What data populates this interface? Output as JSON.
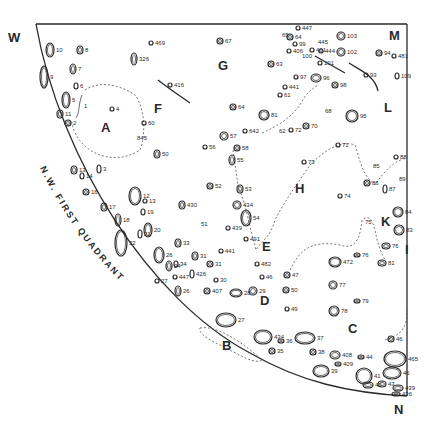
{
  "map": {
    "title": "N.W. FIRST QUADRANT",
    "corners": {
      "west": "W",
      "mare": "M",
      "north": "N"
    },
    "region_letters": [
      {
        "id": "A",
        "x": 101,
        "y": 132
      },
      {
        "id": "B",
        "x": 222,
        "y": 350
      },
      {
        "id": "C",
        "x": 348,
        "y": 333
      },
      {
        "id": "D",
        "x": 260,
        "y": 305
      },
      {
        "id": "E",
        "x": 262,
        "y": 251
      },
      {
        "id": "F",
        "x": 154,
        "y": 113
      },
      {
        "id": "G",
        "x": 218,
        "y": 70
      },
      {
        "id": "H",
        "x": 295,
        "y": 193
      },
      {
        "id": "I",
        "x": 405,
        "y": 254
      },
      {
        "id": "K",
        "x": 381,
        "y": 226
      },
      {
        "id": "L",
        "x": 384,
        "y": 112
      }
    ],
    "craters": [
      {
        "label": "10",
        "x": 50,
        "y": 50,
        "rx": 4,
        "ry": 7
      },
      {
        "label": "8",
        "x": 80,
        "y": 50,
        "rx": 3,
        "ry": 4
      },
      {
        "label": "7",
        "x": 73,
        "y": 69,
        "rx": 3,
        "ry": 5
      },
      {
        "label": "9",
        "x": 44,
        "y": 77,
        "rx": 4,
        "ry": 11
      },
      {
        "label": "6",
        "x": 76,
        "y": 86,
        "rx": 2,
        "ry": 3
      },
      {
        "label": "5",
        "x": 66,
        "y": 100,
        "rx": 4,
        "ry": 8
      },
      {
        "label": "1",
        "x": 82,
        "y": 106,
        "rx": 0,
        "ry": 0
      },
      {
        "label": "11",
        "x": 60,
        "y": 114,
        "rx": 3,
        "ry": 4
      },
      {
        "label": "2",
        "x": 68,
        "y": 123,
        "rx": 3,
        "ry": 3
      },
      {
        "label": "4",
        "x": 112,
        "y": 109,
        "rx": 2,
        "ry": 2
      },
      {
        "label": "469",
        "x": 151,
        "y": 43,
        "rx": 2,
        "ry": 2
      },
      {
        "label": "326",
        "x": 134,
        "y": 59,
        "rx": 3,
        "ry": 6
      },
      {
        "label": "416",
        "x": 170,
        "y": 85,
        "rx": 2,
        "ry": 2
      },
      {
        "label": "60",
        "x": 144,
        "y": 123,
        "rx": 2,
        "ry": 2
      },
      {
        "label": "845",
        "x": 135,
        "y": 138,
        "rx": 0,
        "ry": 0
      },
      {
        "label": "67",
        "x": 220,
        "y": 41,
        "rx": 3,
        "ry": 3
      },
      {
        "label": "13",
        "x": 74,
        "y": 170,
        "rx": 3,
        "ry": 4
      },
      {
        "label": "14",
        "x": 82,
        "y": 176,
        "rx": 2,
        "ry": 3
      },
      {
        "label": "3",
        "x": 99,
        "y": 169,
        "rx": 2,
        "ry": 4
      },
      {
        "label": "16",
        "x": 86,
        "y": 192,
        "rx": 3,
        "ry": 3
      },
      {
        "label": "17",
        "x": 104,
        "y": 207,
        "rx": 3,
        "ry": 4
      },
      {
        "label": "18",
        "x": 118,
        "y": 220,
        "rx": 3,
        "ry": 6
      },
      {
        "label": "22",
        "x": 121,
        "y": 243,
        "rx": 6,
        "ry": 13
      },
      {
        "label": "12",
        "x": 135,
        "y": 196,
        "rx": 6,
        "ry": 9
      },
      {
        "label": "13",
        "x": 145,
        "y": 201,
        "rx": 2,
        "ry": 2
      },
      {
        "label": "19",
        "x": 143,
        "y": 212,
        "rx": 2,
        "ry": 3
      },
      {
        "label": "20",
        "x": 148,
        "y": 230,
        "rx": 4,
        "ry": 7
      },
      {
        "label": "21",
        "x": 140,
        "y": 234,
        "rx": 2,
        "ry": 4
      },
      {
        "label": "50",
        "x": 157,
        "y": 154,
        "rx": 3,
        "ry": 4
      },
      {
        "label": "430",
        "x": 182,
        "y": 205,
        "rx": 3,
        "ry": 4
      },
      {
        "label": "51",
        "x": 199,
        "y": 224,
        "rx": 0,
        "ry": 0
      },
      {
        "label": "52",
        "x": 210,
        "y": 186,
        "rx": 3,
        "ry": 3
      },
      {
        "label": "56",
        "x": 205,
        "y": 147,
        "rx": 2,
        "ry": 2
      },
      {
        "label": "57",
        "x": 224,
        "y": 136,
        "rx": 4,
        "ry": 4
      },
      {
        "label": "58",
        "x": 237,
        "y": 148,
        "rx": 3,
        "ry": 3
      },
      {
        "label": "55",
        "x": 232,
        "y": 160,
        "rx": 3,
        "ry": 5
      },
      {
        "label": "53",
        "x": 240,
        "y": 189,
        "rx": 3,
        "ry": 4
      },
      {
        "label": "64",
        "x": 233,
        "y": 107,
        "rx": 3,
        "ry": 3
      },
      {
        "label": "642",
        "x": 245,
        "y": 131,
        "rx": 2,
        "ry": 2
      },
      {
        "label": "81",
        "x": 264,
        "y": 115,
        "rx": 5,
        "ry": 5
      },
      {
        "label": "62",
        "x": 277,
        "y": 131,
        "rx": 0,
        "ry": 0
      },
      {
        "label": "434",
        "x": 237,
        "y": 205,
        "rx": 4,
        "ry": 4
      },
      {
        "label": "54",
        "x": 246,
        "y": 218,
        "rx": 5,
        "ry": 8
      },
      {
        "label": "439",
        "x": 228,
        "y": 228,
        "rx": 2,
        "ry": 2
      },
      {
        "label": "491",
        "x": 246,
        "y": 239,
        "rx": 2,
        "ry": 2
      },
      {
        "label": "33",
        "x": 178,
        "y": 243,
        "rx": 3,
        "ry": 4
      },
      {
        "label": "31",
        "x": 195,
        "y": 256,
        "rx": 3,
        "ry": 4
      },
      {
        "label": "441",
        "x": 221,
        "y": 251,
        "rx": 2,
        "ry": 2
      },
      {
        "label": "26",
        "x": 159,
        "y": 255,
        "rx": 5,
        "ry": 8
      },
      {
        "label": "24",
        "x": 169,
        "y": 266,
        "rx": 3,
        "ry": 5
      },
      {
        "label": "34",
        "x": 176,
        "y": 264,
        "rx": 2,
        "ry": 3
      },
      {
        "label": "27",
        "x": 157,
        "y": 281,
        "rx": 2,
        "ry": 2
      },
      {
        "label": "447",
        "x": 175,
        "y": 277,
        "rx": 2,
        "ry": 2
      },
      {
        "label": "426",
        "x": 192,
        "y": 274,
        "rx": 2,
        "ry": 4
      },
      {
        "label": "31",
        "x": 210,
        "y": 264,
        "rx": 3,
        "ry": 3
      },
      {
        "label": "30",
        "x": 216,
        "y": 280,
        "rx": 2,
        "ry": 2
      },
      {
        "label": "407",
        "x": 207,
        "y": 291,
        "rx": 3,
        "ry": 3
      },
      {
        "label": "26",
        "x": 178,
        "y": 291,
        "rx": 3,
        "ry": 5
      },
      {
        "label": "482",
        "x": 257,
        "y": 264,
        "rx": 2,
        "ry": 2
      },
      {
        "label": "46",
        "x": 262,
        "y": 277,
        "rx": 2,
        "ry": 2
      },
      {
        "label": "47",
        "x": 287,
        "y": 275,
        "rx": 3,
        "ry": 3
      },
      {
        "label": "28",
        "x": 236,
        "y": 293,
        "rx": 6,
        "ry": 4
      },
      {
        "label": "29",
        "x": 253,
        "y": 291,
        "rx": 4,
        "ry": 4
      },
      {
        "label": "50",
        "x": 286,
        "y": 290,
        "rx": 3,
        "ry": 3
      },
      {
        "label": "49",
        "x": 287,
        "y": 309,
        "rx": 2,
        "ry": 2
      },
      {
        "label": "27",
        "x": 226,
        "y": 320,
        "rx": 10,
        "ry": 7
      },
      {
        "label": "434",
        "x": 263,
        "y": 337,
        "rx": 9,
        "ry": 7
      },
      {
        "label": "36",
        "x": 281,
        "y": 341,
        "rx": 3,
        "ry": 2
      },
      {
        "label": "35",
        "x": 272,
        "y": 351,
        "rx": 3,
        "ry": 3
      },
      {
        "label": "37",
        "x": 305,
        "y": 338,
        "rx": 10,
        "ry": 6
      },
      {
        "label": "38",
        "x": 313,
        "y": 352,
        "rx": 3,
        "ry": 3
      },
      {
        "label": "39",
        "x": 321,
        "y": 371,
        "rx": 8,
        "ry": 6
      },
      {
        "label": "408",
        "x": 335,
        "y": 355,
        "rx": 5,
        "ry": 4
      },
      {
        "label": "409",
        "x": 338,
        "y": 364,
        "rx": 3,
        "ry": 2
      },
      {
        "label": "44",
        "x": 361,
        "y": 357,
        "rx": 3,
        "ry": 2
      },
      {
        "label": "41",
        "x": 364,
        "y": 376,
        "rx": 8,
        "ry": 8
      },
      {
        "label": "42",
        "x": 368,
        "y": 385,
        "rx": 5,
        "ry": 3
      },
      {
        "label": "43",
        "x": 382,
        "y": 384,
        "rx": 4,
        "ry": 3
      },
      {
        "label": "439",
        "x": 398,
        "y": 388,
        "rx": 5,
        "ry": 3
      },
      {
        "label": "436",
        "x": 396,
        "y": 394,
        "rx": 4,
        "ry": 2
      },
      {
        "label": "46",
        "x": 391,
        "y": 339,
        "rx": 3,
        "ry": 3
      },
      {
        "label": "465",
        "x": 395,
        "y": 359,
        "rx": 11,
        "ry": 8
      },
      {
        "label": "46",
        "x": 392,
        "y": 373,
        "rx": 9,
        "ry": 6
      },
      {
        "label": "77",
        "x": 333,
        "y": 285,
        "rx": 4,
        "ry": 4
      },
      {
        "label": "79",
        "x": 357,
        "y": 301,
        "rx": 3,
        "ry": 2
      },
      {
        "label": "78",
        "x": 334,
        "y": 311,
        "rx": 5,
        "ry": 5
      },
      {
        "label": "472",
        "x": 335,
        "y": 262,
        "rx": 6,
        "ry": 5
      },
      {
        "label": "76",
        "x": 357,
        "y": 255,
        "rx": 3,
        "ry": 2
      },
      {
        "label": "76",
        "x": 386,
        "y": 246,
        "rx": 4,
        "ry": 3
      },
      {
        "label": "81",
        "x": 382,
        "y": 263,
        "rx": 4,
        "ry": 3
      },
      {
        "label": "84",
        "x": 398,
        "y": 212,
        "rx": 5,
        "ry": 5
      },
      {
        "label": "83",
        "x": 399,
        "y": 230,
        "rx": 5,
        "ry": 5
      },
      {
        "label": "74",
        "x": 340,
        "y": 196,
        "rx": 2,
        "ry": 2
      },
      {
        "label": "75",
        "x": 363,
        "y": 222,
        "rx": 0,
        "ry": 0
      },
      {
        "label": "86",
        "x": 367,
        "y": 183,
        "rx": 3,
        "ry": 3
      },
      {
        "label": "87",
        "x": 385,
        "y": 189,
        "rx": 2,
        "ry": 4
      },
      {
        "label": "85",
        "x": 371,
        "y": 166,
        "rx": 0,
        "ry": 0
      },
      {
        "label": "88",
        "x": 396,
        "y": 157,
        "rx": 2,
        "ry": 2
      },
      {
        "label": "89",
        "x": 397,
        "y": 179,
        "rx": 0,
        "ry": 0
      },
      {
        "label": "73",
        "x": 304,
        "y": 162,
        "rx": 2,
        "ry": 2
      },
      {
        "label": "71",
        "x": 338,
        "y": 145,
        "rx": 2,
        "ry": 2
      },
      {
        "label": "95",
        "x": 352,
        "y": 116,
        "rx": 6,
        "ry": 6
      },
      {
        "label": "70",
        "x": 306,
        "y": 126,
        "rx": 3,
        "ry": 3
      },
      {
        "label": "72",
        "x": 291,
        "y": 130,
        "rx": 2,
        "ry": 2
      },
      {
        "label": "68",
        "x": 323,
        "y": 111,
        "rx": 0,
        "ry": 0
      },
      {
        "label": "96",
        "x": 316,
        "y": 78,
        "rx": 5,
        "ry": 4
      },
      {
        "label": "98",
        "x": 335,
        "y": 85,
        "rx": 3,
        "ry": 3
      },
      {
        "label": "97",
        "x": 296,
        "y": 77,
        "rx": 2,
        "ry": 2
      },
      {
        "label": "441",
        "x": 285,
        "y": 87,
        "rx": 2,
        "ry": 2
      },
      {
        "label": "61",
        "x": 280,
        "y": 95,
        "rx": 2,
        "ry": 2
      },
      {
        "label": "63",
        "x": 271,
        "y": 64,
        "rx": 3,
        "ry": 3
      },
      {
        "label": "65",
        "x": 280,
        "y": 35,
        "rx": 0,
        "ry": 0
      },
      {
        "label": "64",
        "x": 290,
        "y": 37,
        "rx": 3,
        "ry": 3
      },
      {
        "label": "447",
        "x": 298,
        "y": 28,
        "rx": 2,
        "ry": 2
      },
      {
        "label": "99",
        "x": 295,
        "y": 44,
        "rx": 2,
        "ry": 2
      },
      {
        "label": "406",
        "x": 289,
        "y": 51,
        "rx": 2,
        "ry": 2
      },
      {
        "label": "100",
        "x": 300,
        "y": 56,
        "rx": 0,
        "ry": 0
      },
      {
        "label": "445",
        "x": 316,
        "y": 42,
        "rx": 0,
        "ry": 0
      },
      {
        "label": "461",
        "x": 312,
        "y": 50,
        "rx": 2,
        "ry": 2
      },
      {
        "label": "444",
        "x": 321,
        "y": 51,
        "rx": 2,
        "ry": 2
      },
      {
        "label": "103",
        "x": 341,
        "y": 36,
        "rx": 4,
        "ry": 4
      },
      {
        "label": "102",
        "x": 341,
        "y": 52,
        "rx": 4,
        "ry": 4
      },
      {
        "label": "101",
        "x": 320,
        "y": 63,
        "rx": 2,
        "ry": 2
      },
      {
        "label": "93",
        "x": 366,
        "y": 75,
        "rx": 2,
        "ry": 2
      },
      {
        "label": "94",
        "x": 379,
        "y": 53,
        "rx": 3,
        "ry": 3
      },
      {
        "label": "481",
        "x": 394,
        "y": 56,
        "rx": 2,
        "ry": 2
      },
      {
        "label": "109",
        "x": 397,
        "y": 76,
        "rx": 2,
        "ry": 3
      }
    ]
  }
}
